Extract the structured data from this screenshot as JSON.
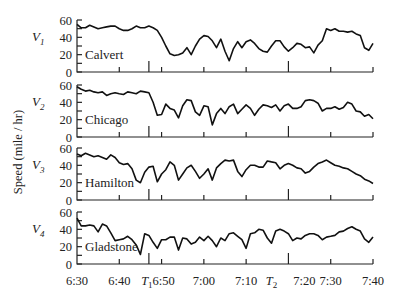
{
  "chart_data": {
    "type": "line",
    "title": "",
    "ylabel": "Speed (mile / hr)",
    "xlabel": "",
    "x_unit": "minutes after 6:30",
    "x_range": [
      0,
      70
    ],
    "ylim": [
      0,
      60
    ],
    "y_ticks": [
      0,
      20,
      40,
      60
    ],
    "grid": false,
    "legend": "none",
    "x_tick_labels": [
      {
        "t": 0,
        "label": "6:30"
      },
      {
        "t": 10,
        "label": "6:40"
      },
      {
        "t": 20,
        "label": "6:50"
      },
      {
        "t": 30,
        "label": "7:00"
      },
      {
        "t": 40,
        "label": "7:10"
      },
      {
        "t": 50,
        "label": "7:20"
      },
      {
        "t": 60,
        "label": "7:30"
      },
      {
        "t": 70,
        "label": "7:40"
      }
    ],
    "markers": [
      {
        "name": "T1",
        "t": 17,
        "label": "T",
        "sub": "1"
      },
      {
        "name": "T2",
        "t": 50,
        "label": "T",
        "sub": "2"
      }
    ],
    "panels": [
      {
        "var": "V",
        "sub": "1",
        "station": "Calvert",
        "points": [
          [
            0,
            55
          ],
          [
            1,
            51
          ],
          [
            2,
            51
          ],
          [
            3,
            54
          ],
          [
            4,
            52
          ],
          [
            5,
            50
          ],
          [
            6,
            51
          ],
          [
            7,
            52
          ],
          [
            8,
            53
          ],
          [
            9,
            53
          ],
          [
            10,
            50
          ],
          [
            11,
            48
          ],
          [
            12,
            48
          ],
          [
            13,
            50
          ],
          [
            14,
            53
          ],
          [
            15,
            51
          ],
          [
            16,
            51
          ],
          [
            17,
            53
          ],
          [
            18,
            51
          ],
          [
            19,
            48
          ],
          [
            20,
            40
          ],
          [
            21,
            30
          ],
          [
            22,
            21
          ],
          [
            23,
            19
          ],
          [
            24,
            20
          ],
          [
            25,
            22
          ],
          [
            26,
            28
          ],
          [
            27,
            20
          ],
          [
            28,
            30
          ],
          [
            29,
            38
          ],
          [
            30,
            42
          ],
          [
            31,
            41
          ],
          [
            32,
            36
          ],
          [
            33,
            28
          ],
          [
            34,
            38
          ],
          [
            35,
            24
          ],
          [
            36,
            13
          ],
          [
            37,
            27
          ],
          [
            38,
            35
          ],
          [
            39,
            28
          ],
          [
            40,
            35
          ],
          [
            41,
            37
          ],
          [
            42,
            33
          ],
          [
            43,
            27
          ],
          [
            44,
            24
          ],
          [
            45,
            23
          ],
          [
            46,
            30
          ],
          [
            47,
            36
          ],
          [
            48,
            36
          ],
          [
            49,
            29
          ],
          [
            50,
            24
          ],
          [
            51,
            28
          ],
          [
            52,
            33
          ],
          [
            53,
            32
          ],
          [
            54,
            28
          ],
          [
            55,
            29
          ],
          [
            56,
            22
          ],
          [
            57,
            31
          ],
          [
            58,
            36
          ],
          [
            59,
            50
          ],
          [
            60,
            48
          ],
          [
            61,
            50
          ],
          [
            62,
            47
          ],
          [
            63,
            47
          ],
          [
            64,
            46
          ],
          [
            65,
            47
          ],
          [
            66,
            44
          ],
          [
            67,
            42
          ],
          [
            68,
            28
          ],
          [
            69,
            25
          ],
          [
            70,
            33
          ]
        ]
      },
      {
        "var": "V",
        "sub": "2",
        "station": "Chicago",
        "points": [
          [
            0,
            58
          ],
          [
            1,
            55
          ],
          [
            2,
            53
          ],
          [
            3,
            54
          ],
          [
            4,
            52
          ],
          [
            5,
            51
          ],
          [
            6,
            52
          ],
          [
            7,
            48
          ],
          [
            8,
            50
          ],
          [
            9,
            51
          ],
          [
            10,
            50
          ],
          [
            11,
            49
          ],
          [
            12,
            52
          ],
          [
            13,
            51
          ],
          [
            14,
            50
          ],
          [
            15,
            53
          ],
          [
            16,
            52
          ],
          [
            17,
            51
          ],
          [
            18,
            40
          ],
          [
            19,
            25
          ],
          [
            20,
            26
          ],
          [
            21,
            38
          ],
          [
            22,
            33
          ],
          [
            23,
            31
          ],
          [
            24,
            22
          ],
          [
            25,
            36
          ],
          [
            26,
            43
          ],
          [
            27,
            42
          ],
          [
            28,
            29
          ],
          [
            29,
            25
          ],
          [
            30,
            36
          ],
          [
            31,
            35
          ],
          [
            32,
            14
          ],
          [
            33,
            27
          ],
          [
            34,
            33
          ],
          [
            35,
            27
          ],
          [
            36,
            35
          ],
          [
            37,
            38
          ],
          [
            38,
            27
          ],
          [
            39,
            32
          ],
          [
            40,
            37
          ],
          [
            41,
            33
          ],
          [
            42,
            25
          ],
          [
            43,
            32
          ],
          [
            44,
            37
          ],
          [
            45,
            36
          ],
          [
            46,
            34
          ],
          [
            47,
            37
          ],
          [
            48,
            30
          ],
          [
            49,
            36
          ],
          [
            50,
            38
          ],
          [
            51,
            33
          ],
          [
            52,
            33
          ],
          [
            53,
            35
          ],
          [
            54,
            42
          ],
          [
            55,
            43
          ],
          [
            56,
            42
          ],
          [
            57,
            39
          ],
          [
            58,
            30
          ],
          [
            59,
            33
          ],
          [
            60,
            33
          ],
          [
            61,
            35
          ],
          [
            62,
            32
          ],
          [
            63,
            34
          ],
          [
            64,
            40
          ],
          [
            65,
            38
          ],
          [
            66,
            30
          ],
          [
            67,
            29
          ],
          [
            68,
            24
          ],
          [
            69,
            26
          ],
          [
            70,
            21
          ]
        ]
      },
      {
        "var": "V",
        "sub": "3",
        "station": "Hamilton",
        "points": [
          [
            0,
            53
          ],
          [
            1,
            51
          ],
          [
            2,
            54
          ],
          [
            3,
            52
          ],
          [
            4,
            50
          ],
          [
            5,
            51
          ],
          [
            6,
            49
          ],
          [
            7,
            47
          ],
          [
            8,
            52
          ],
          [
            9,
            49
          ],
          [
            10,
            43
          ],
          [
            11,
            41
          ],
          [
            12,
            42
          ],
          [
            13,
            36
          ],
          [
            14,
            23
          ],
          [
            15,
            20
          ],
          [
            16,
            32
          ],
          [
            17,
            38
          ],
          [
            18,
            39
          ],
          [
            19,
            21
          ],
          [
            20,
            30
          ],
          [
            21,
            35
          ],
          [
            22,
            44
          ],
          [
            23,
            40
          ],
          [
            24,
            23
          ],
          [
            25,
            30
          ],
          [
            26,
            37
          ],
          [
            27,
            40
          ],
          [
            28,
            33
          ],
          [
            29,
            25
          ],
          [
            30,
            30
          ],
          [
            31,
            36
          ],
          [
            32,
            23
          ],
          [
            33,
            37
          ],
          [
            34,
            42
          ],
          [
            35,
            46
          ],
          [
            36,
            45
          ],
          [
            37,
            46
          ],
          [
            38,
            33
          ],
          [
            39,
            27
          ],
          [
            40,
            35
          ],
          [
            41,
            40
          ],
          [
            42,
            40
          ],
          [
            43,
            38
          ],
          [
            44,
            38
          ],
          [
            45,
            45
          ],
          [
            46,
            44
          ],
          [
            47,
            43
          ],
          [
            48,
            36
          ],
          [
            49,
            40
          ],
          [
            50,
            42
          ],
          [
            51,
            40
          ],
          [
            52,
            37
          ],
          [
            53,
            36
          ],
          [
            54,
            31
          ],
          [
            55,
            33
          ],
          [
            56,
            38
          ],
          [
            57,
            42
          ],
          [
            58,
            44
          ],
          [
            59,
            46
          ],
          [
            60,
            43
          ],
          [
            61,
            40
          ],
          [
            62,
            39
          ],
          [
            63,
            37
          ],
          [
            64,
            36
          ],
          [
            65,
            33
          ],
          [
            66,
            30
          ],
          [
            67,
            28
          ],
          [
            68,
            24
          ],
          [
            69,
            22
          ],
          [
            70,
            19
          ]
        ]
      },
      {
        "var": "V",
        "sub": "4",
        "station": "Gladstone",
        "points": [
          [
            0,
            53
          ],
          [
            1,
            44
          ],
          [
            2,
            44
          ],
          [
            3,
            45
          ],
          [
            4,
            44
          ],
          [
            5,
            37
          ],
          [
            6,
            46
          ],
          [
            7,
            44
          ],
          [
            8,
            36
          ],
          [
            9,
            27
          ],
          [
            10,
            28
          ],
          [
            11,
            29
          ],
          [
            12,
            32
          ],
          [
            13,
            28
          ],
          [
            14,
            22
          ],
          [
            15,
            11
          ],
          [
            16,
            35
          ],
          [
            17,
            33
          ],
          [
            18,
            25
          ],
          [
            19,
            18
          ],
          [
            20,
            28
          ],
          [
            21,
            28
          ],
          [
            22,
            31
          ],
          [
            23,
            31
          ],
          [
            24,
            16
          ],
          [
            25,
            30
          ],
          [
            26,
            29
          ],
          [
            27,
            23
          ],
          [
            28,
            25
          ],
          [
            29,
            31
          ],
          [
            30,
            27
          ],
          [
            31,
            32
          ],
          [
            32,
            27
          ],
          [
            33,
            20
          ],
          [
            34,
            30
          ],
          [
            35,
            27
          ],
          [
            36,
            35
          ],
          [
            37,
            36
          ],
          [
            38,
            32
          ],
          [
            39,
            28
          ],
          [
            40,
            18
          ],
          [
            41,
            35
          ],
          [
            42,
            36
          ],
          [
            43,
            40
          ],
          [
            44,
            39
          ],
          [
            45,
            30
          ],
          [
            46,
            24
          ],
          [
            47,
            38
          ],
          [
            48,
            40
          ],
          [
            49,
            38
          ],
          [
            50,
            35
          ],
          [
            51,
            27
          ],
          [
            52,
            30
          ],
          [
            53,
            29
          ],
          [
            54,
            33
          ],
          [
            55,
            35
          ],
          [
            56,
            35
          ],
          [
            57,
            33
          ],
          [
            58,
            28
          ],
          [
            59,
            31
          ],
          [
            60,
            32
          ],
          [
            61,
            33
          ],
          [
            62,
            37
          ],
          [
            63,
            38
          ],
          [
            64,
            41
          ],
          [
            65,
            43
          ],
          [
            66,
            40
          ],
          [
            67,
            38
          ],
          [
            68,
            29
          ],
          [
            69,
            25
          ],
          [
            70,
            31
          ]
        ]
      }
    ]
  }
}
